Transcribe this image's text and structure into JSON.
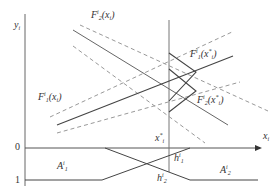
{
  "axes": {
    "y_label": "y",
    "y_label_sub": "i",
    "x_label": "x",
    "x_label_sub": "i",
    "tick_0": "0",
    "tick_1": "1"
  },
  "curves": {
    "f2": {
      "name": "F",
      "sup": "i",
      "sub": "2",
      "arg": "(x",
      "arg_sub": "i",
      "arg_close": ")"
    },
    "f1": {
      "name": "F",
      "sup": "i",
      "sub": "1",
      "arg": "(x",
      "arg_sub": "i",
      "arg_close": ")"
    },
    "f1_at_star": {
      "name": "F",
      "sup": "i",
      "sub": "1",
      "arg": "(x",
      "arg_sup": "*",
      "arg_sub": "i",
      "arg_close": ")"
    },
    "f2_at_star": {
      "name": "F",
      "sup": "i",
      "sub": "2",
      "arg": "(x",
      "arg_sup": "*",
      "arg_sub": "i",
      "arg_close": ")"
    }
  },
  "markers": {
    "x_star": {
      "name": "x",
      "sup": "*",
      "sub": "i"
    },
    "h1": {
      "name": "h",
      "sup": "i",
      "sub": "1"
    },
    "h2": {
      "name": "h",
      "sup": "i",
      "sub": "2"
    }
  },
  "regions": {
    "a1": {
      "name": "A",
      "sup": "i",
      "sub": "1"
    },
    "a2": {
      "name": "A",
      "sup": "i",
      "sub": "2"
    }
  },
  "colors": {
    "solid_line": "#555555",
    "dashed_line": "#999999",
    "axis": "#555555"
  }
}
